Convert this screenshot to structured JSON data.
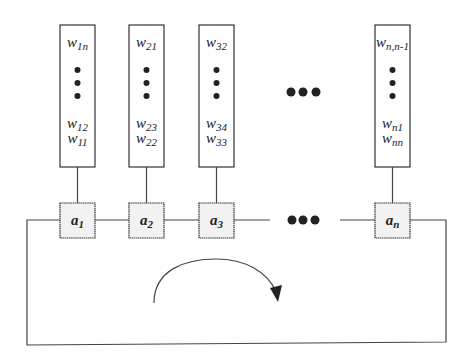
{
  "diagram": {
    "columns": [
      {
        "top": {
          "base": "w",
          "sub": "1n"
        },
        "bottom1": {
          "base": "w",
          "sub": "12"
        },
        "bottom2": {
          "base": "w",
          "sub": "11"
        },
        "node": {
          "base": "a",
          "sub": "1"
        },
        "node_shading": "light"
      },
      {
        "top": {
          "base": "w",
          "sub": "21"
        },
        "bottom1": {
          "base": "w",
          "sub": "23"
        },
        "bottom2": {
          "base": "w",
          "sub": "22"
        },
        "node": {
          "base": "a",
          "sub": "2"
        },
        "node_shading": "light"
      },
      {
        "top": {
          "base": "w",
          "sub": "32"
        },
        "bottom1": {
          "base": "w",
          "sub": "34"
        },
        "bottom2": {
          "base": "w",
          "sub": "33"
        },
        "node": {
          "base": "a",
          "sub": "3"
        },
        "node_shading": "speckled"
      },
      {
        "top": {
          "base": "w",
          "sub": "n,n-1"
        },
        "bottom1": {
          "base": "w",
          "sub": "n1"
        },
        "bottom2": {
          "base": "w",
          "sub": "nn"
        },
        "node": {
          "base": "a",
          "sub": "n"
        },
        "node_shading": "speckled"
      }
    ],
    "ellipsis": "•••",
    "loop_direction": "clockwise"
  }
}
